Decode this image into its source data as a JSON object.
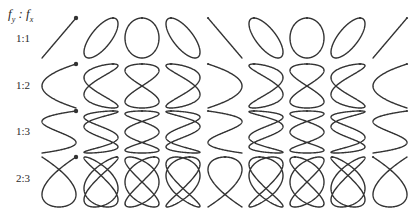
{
  "header": {
    "f": "f",
    "y_sub": "y",
    "sep": " : ",
    "x_sub": "x"
  },
  "figure_type": "lissajous-grid",
  "colors": {
    "stroke": "#333333",
    "background": "#ffffff"
  },
  "phase_columns": 9,
  "columns_cx": [
    59,
    101,
    142,
    183,
    225,
    266,
    307,
    348,
    390
  ],
  "cell_half_width": 17,
  "rows": [
    {
      "label": "1:1",
      "fy": 1,
      "fx": 1,
      "label_y": 32,
      "cy": 38,
      "half_height": 20
    },
    {
      "label": "1:2",
      "fy": 1,
      "fx": 2,
      "label_y": 79,
      "cy": 86,
      "half_height": 22
    },
    {
      "label": "1:3",
      "fy": 1,
      "fx": 3,
      "label_y": 125,
      "cy": 132,
      "half_height": 21
    },
    {
      "label": "2:3",
      "fy": 2,
      "fx": 3,
      "label_y": 172,
      "cy": 182,
      "half_height": 25
    }
  ]
}
